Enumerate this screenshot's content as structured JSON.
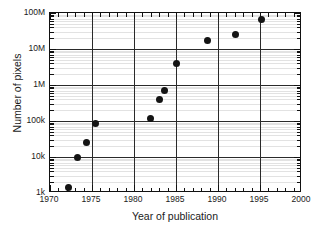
{
  "chart_data": {
    "type": "scatter",
    "title": "",
    "xlabel": "Year of publication",
    "ylabel": "Number of pixels",
    "xlim": [
      1970,
      2000
    ],
    "ylim": [
      1000,
      100000000
    ],
    "yscale": "log",
    "xscale": "linear",
    "grid": true,
    "legend": null,
    "xticks": [
      1970,
      1975,
      1980,
      1985,
      1990,
      1995,
      2000
    ],
    "xtick_labels": [
      "1970",
      "1975",
      "1980",
      "1985",
      "1990",
      "1995",
      "2000"
    ],
    "x_minor_tick_step": 1,
    "yticks": [
      1000,
      10000,
      100000,
      1000000,
      10000000,
      100000000
    ],
    "ytick_labels": [
      "1k",
      "10k",
      "100k",
      "1M",
      "10M",
      "100M"
    ],
    "x": [
      1972.2,
      1973.3,
      1974.3,
      1975.4,
      1982.0,
      1983.0,
      1983.6,
      1985.1,
      1988.8,
      1992.1,
      1995.2
    ],
    "y": [
      1400,
      10000,
      26000,
      85000,
      120000,
      400000,
      700000,
      4000000,
      17000000,
      26000000,
      65000000
    ],
    "marker": "filled-circle",
    "marker_color": "#141414",
    "marker_size_px": 7,
    "points": [
      {
        "x": 1972.2,
        "y": 1400,
        "label": "1972, 1.4k pixels"
      },
      {
        "x": 1973.3,
        "y": 10000,
        "label": "1973, 10k pixels"
      },
      {
        "x": 1974.3,
        "y": 26000,
        "label": "1974, 26k pixels"
      },
      {
        "x": 1975.4,
        "y": 85000,
        "label": "1975, 85k pixels"
      },
      {
        "x": 1982.0,
        "y": 120000,
        "label": "1982, 120k pixels"
      },
      {
        "x": 1983.0,
        "y": 400000,
        "label": "1983, 400k pixels"
      },
      {
        "x": 1983.6,
        "y": 700000,
        "label": "1984, 700k pixels"
      },
      {
        "x": 1985.1,
        "y": 4000000,
        "label": "1985, 4M pixels"
      },
      {
        "x": 1988.8,
        "y": 17000000,
        "label": "1989, 17M pixels"
      },
      {
        "x": 1992.1,
        "y": 26000000,
        "label": "1992, 26M pixels"
      },
      {
        "x": 1995.2,
        "y": 65000000,
        "label": "1995, 65M pixels"
      }
    ]
  },
  "colors": {
    "background": "#ffffff",
    "axis": "#111111",
    "major_grid": "#2a2a2a",
    "minor_grid": "#e2e2e2",
    "marker": "#141414",
    "text": "#1a1a1a"
  }
}
